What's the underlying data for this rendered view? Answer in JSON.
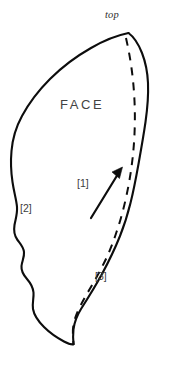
{
  "figure": {
    "kind": "outcrop-face-sketch",
    "background_color": "#ffffff",
    "ink_color": "#0d0d0d",
    "label_color": "#3d3d3d",
    "width": 170,
    "height": 368
  },
  "labels": {
    "top": "top",
    "face": "FACE",
    "annotation_1": "[1]",
    "annotation_2": "[2]",
    "annotation_3": "[3]"
  },
  "geometry": {
    "outline": {
      "name": "face-outline",
      "style": "solid",
      "path": "M 128.5 33 C 116 35.5 103 41 91 48 C 76 56.5 62 67 50 79 C 38.5 90.5 29 103 22 116 C 16 127 12.5 139 11.5 151 C 10.5 162 11 172 12.5 182 C 14 192.5 16.5 200 17 207 C 17.5 214 15.5 219 14.5 225 C 13.5 231 14.5 236 17.5 240 C 20.5 244 23.5 247 24 252 C 24.5 257 22 261 21.5 266 C 21 271.5 23.5 275 27 279 C 30.5 283 33 287 33.5 292.5 C 34 298 32 303 33 309 C 34 315 38 321 44 327 C 50 333 57.5 338 64 341.5 C 68 343.7 71 344.6 73.5 344.3"
    },
    "outline_right": {
      "name": "face-outline-right-edge",
      "style": "solid",
      "path": "M 128.5 33 C 134 37 138.5 44 142 53 C 145.5 62 147.5 72 148 83 C 148.5 95 147.5 108 145.5 122 C 143.5 136 141 150 138.5 164 C 136 178 133.5 191 130.5 203 C 127.5 215 124 226 120 236 C 115 248.5 109 261 102 274 C 95.5 286 88 298 81 309 C 77 315.5 74.5 322 73.5 329 C 73 334 73 339.5 73.5 344.3"
    },
    "dashed_seam": {
      "name": "dashed-seam-line",
      "style": "dashed",
      "dash_pattern": "8 7",
      "path": "M 126 38 C 128 47 130 57 131.5 68 C 133 79 134 90 134.5 101 C 135 112 135 123 134.5 134 C 134 145 133 156 131.5 167 C 130 178 128 189 125.5 200 C 123 211 120 222 116.5 232 C 113 243 109 253 104 263 C 99 273 93.5 283 88 292 C 83 300.5 78.5 309 75.5 317 C 73.5 323 72.5 329 73 335 C 73.2 338.5 73.4 341.5 73.5 344.3"
    },
    "arrow": {
      "name": "direction-arrow",
      "shaft": {
        "x1": 91,
        "y1": 218,
        "x2": 118,
        "y2": 174
      },
      "head_points": "122.5 167 119.5 178.5 112.0 172.0",
      "direction": "up-right"
    }
  },
  "label_positions": {
    "top": {
      "x": 105,
      "y": 10
    },
    "face": {
      "x": 60,
      "y": 98
    },
    "annotation_1": {
      "x": 77,
      "y": 178
    },
    "annotation_2": {
      "x": 20,
      "y": 203
    },
    "annotation_3": {
      "x": 95,
      "y": 271
    }
  }
}
